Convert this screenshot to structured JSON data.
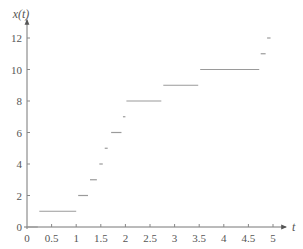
{
  "chart_data": {
    "type": "line",
    "subtype": "step",
    "title": "",
    "xlabel": "t",
    "ylabel": "x(t)",
    "xlim": [
      0,
      5.2
    ],
    "ylim": [
      0,
      12.5
    ],
    "xticks": [
      0,
      0.5,
      1,
      1.5,
      2,
      2.5,
      3,
      3.5,
      4,
      4.5,
      5
    ],
    "xtick_labels": [
      "0",
      "0.5",
      "1",
      "1.5",
      "2",
      "2.5",
      "3",
      "3.5",
      "4",
      "4.5",
      "5"
    ],
    "yticks": [
      0,
      2,
      4,
      6,
      8,
      10,
      12
    ],
    "ytick_labels": [
      "0",
      "2",
      "4",
      "6",
      "8",
      "10",
      "12"
    ],
    "grid": false,
    "legend": "none",
    "segments": [
      {
        "value": 0,
        "t_start": 0.0,
        "t_end": 0.22
      },
      {
        "value": 1,
        "t_start": 0.25,
        "t_end": 1.0
      },
      {
        "value": 2,
        "t_start": 1.04,
        "t_end": 1.24
      },
      {
        "value": 3,
        "t_start": 1.28,
        "t_end": 1.42
      },
      {
        "value": 4,
        "t_start": 1.47,
        "t_end": 1.54
      },
      {
        "value": 5,
        "t_start": 1.58,
        "t_end": 1.64
      },
      {
        "value": 6,
        "t_start": 1.71,
        "t_end": 1.92
      },
      {
        "value": 7,
        "t_start": 1.95,
        "t_end": 2.0
      },
      {
        "value": 8,
        "t_start": 2.02,
        "t_end": 2.73
      },
      {
        "value": 9,
        "t_start": 2.77,
        "t_end": 3.48
      },
      {
        "value": 10,
        "t_start": 3.52,
        "t_end": 4.72
      },
      {
        "value": 11,
        "t_start": 4.75,
        "t_end": 4.85
      },
      {
        "value": 12,
        "t_start": 4.88,
        "t_end": 4.95
      }
    ],
    "colors": {
      "axis": "#777777",
      "step": "#9a9a9a",
      "text": "#555555"
    }
  }
}
